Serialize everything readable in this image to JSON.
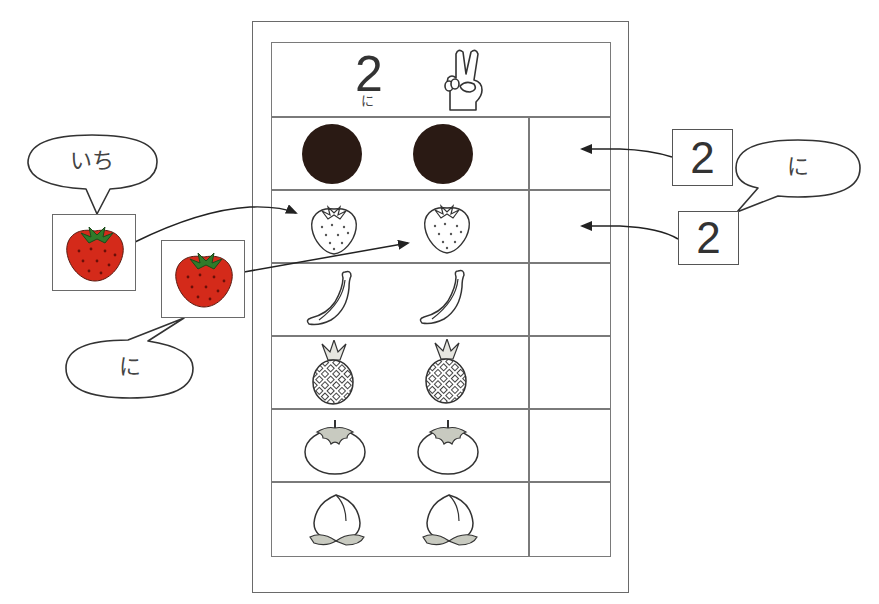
{
  "worksheet": {
    "header": {
      "number": "2",
      "reading": "に",
      "hand_icon": "peace-sign-hand-icon"
    },
    "rows": [
      {
        "item": "black-dot",
        "count": 2,
        "answer": ""
      },
      {
        "item": "strawberry",
        "count": 2,
        "answer": ""
      },
      {
        "item": "banana",
        "count": 2,
        "answer": ""
      },
      {
        "item": "pineapple",
        "count": 2,
        "answer": ""
      },
      {
        "item": "persimmon",
        "count": 2,
        "answer": ""
      },
      {
        "item": "peach",
        "count": 2,
        "answer": ""
      }
    ]
  },
  "left_annotations": {
    "bubble_1": {
      "text": "いち"
    },
    "bubble_2": {
      "text": "に"
    },
    "strawberry_cards": [
      {
        "icon": "strawberry-icon",
        "target_row": 1,
        "target_slot": 1
      },
      {
        "icon": "strawberry-icon",
        "target_row": 1,
        "target_slot": 2
      }
    ]
  },
  "right_annotations": {
    "number_cards": [
      {
        "value": "2",
        "target_row": 0
      },
      {
        "value": "2",
        "target_row": 1
      }
    ],
    "bubble": {
      "text": "に"
    }
  },
  "colors": {
    "line": "#6a6a6a",
    "dot": "#2a1a14",
    "strawberry_red": "#d42a1a",
    "strawberry_leaf": "#2f7a2a",
    "leaf_gray": "#c8cac0"
  }
}
